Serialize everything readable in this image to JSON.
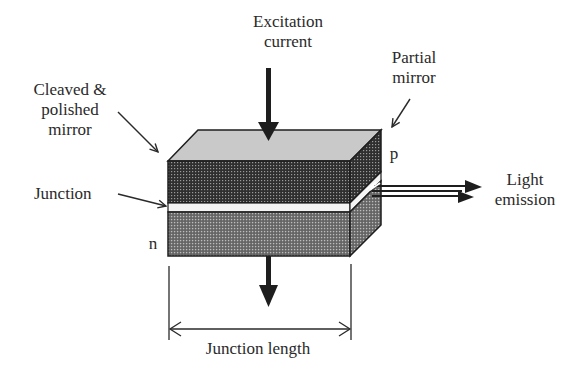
{
  "diagram": {
    "labels": {
      "excitation": [
        "Excitation",
        "current"
      ],
      "cleaved_mirror": [
        "Cleaved &",
        "polished",
        "mirror"
      ],
      "partial_mirror": [
        "Partial",
        "mirror"
      ],
      "p_region": "p",
      "junction": "Junction",
      "n_region": "n",
      "light_emission": [
        "Light",
        "emission"
      ],
      "junction_length": "Junction length"
    },
    "colors": {
      "top_face": "#c9c9c9",
      "p_layer": "#3a3a3a",
      "n_layer": "#7a7a7a",
      "junction_band": "#f4f4f4",
      "outline": "#1e1e1e",
      "arrow": "#1e1e1e",
      "text": "#2a2a2a"
    }
  }
}
